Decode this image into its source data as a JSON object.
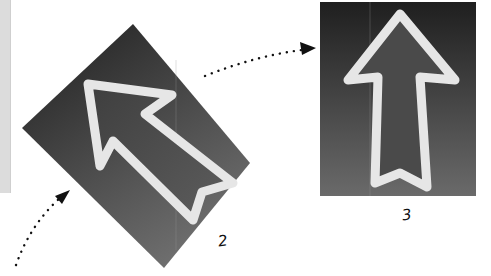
{
  "panels": [
    {
      "id": "2",
      "label": "2",
      "description": "rotated dark panel with arrow pointing up-left"
    },
    {
      "id": "3",
      "label": "3",
      "description": "upright dark panel with arrow pointing up"
    }
  ],
  "colors": {
    "panel_dark": "#2a2a2a",
    "panel_light": "#6a6a6a",
    "arrow_stroke": "#e6e6e6",
    "arrow_fill": "#555555",
    "dots": "#111111",
    "sidebar": "#dcdcdc"
  },
  "connectors": [
    {
      "from": "bottom-left",
      "to": "2",
      "style": "dotted-arrow"
    },
    {
      "from": "2",
      "to": "3",
      "style": "dotted-arrow"
    }
  ]
}
